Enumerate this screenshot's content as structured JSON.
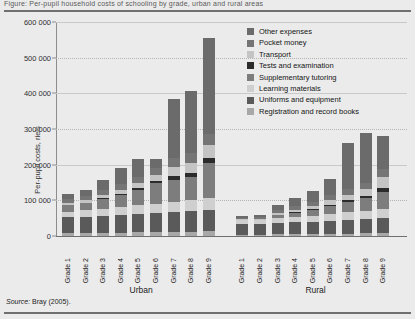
{
  "figure": {
    "title_strip": "Figure: Per-pupil household costs of schooling by grade, urban and rural areas",
    "source_prefix": "Source:",
    "source_text": "Bray (2005)."
  },
  "axis": {
    "ylabel": "Per-pupil costs, riels",
    "yticks": [
      "0",
      "100 000",
      "200 000",
      "300 000",
      "400 000",
      "500 000",
      "600 000"
    ],
    "ytick_values": [
      0,
      100000,
      200000,
      300000,
      400000,
      500000,
      600000
    ]
  },
  "groups": [
    {
      "name": "Urban",
      "label": "Urban"
    },
    {
      "name": "Rural",
      "label": "Rural"
    }
  ],
  "categories": [
    "Grade 1",
    "Grade 2",
    "Grade 3",
    "Grade 4",
    "Grade 5",
    "Grade 6",
    "Grade 7",
    "Grade 8",
    "Grade 9"
  ],
  "legend": {
    "position": "top-right",
    "items": [
      {
        "label": "Other expenses",
        "color": "#6b6b6b"
      },
      {
        "label": "Pocket money",
        "color": "#757575"
      },
      {
        "label": "Transport",
        "color": "#c4c4c4"
      },
      {
        "label": "Tests and examination",
        "color": "#2b2b2b"
      },
      {
        "label": "Supplementary tutoring",
        "color": "#7d7d7d"
      },
      {
        "label": "Learning materials",
        "color": "#cfcfcf"
      },
      {
        "label": "Uniforms and equipment",
        "color": "#5a5a5a"
      },
      {
        "label": "Registration and record books",
        "color": "#a8a8a8"
      }
    ]
  },
  "chart_data": {
    "type": "bar",
    "subtype": "stacked-bar-grouped",
    "title": "Per-pupil household costs of schooling by grade, urban and rural areas",
    "xlabel": "",
    "ylabel": "Per-pupil costs, riels",
    "ylim": [
      0,
      600000
    ],
    "ytick_step": 100000,
    "grid": true,
    "legend_position": "top-right",
    "categories": [
      "Grade 1",
      "Grade 2",
      "Grade 3",
      "Grade 4",
      "Grade 5",
      "Grade 6",
      "Grade 7",
      "Grade 8",
      "Grade 9"
    ],
    "groups": [
      "Urban",
      "Rural"
    ],
    "series": [
      {
        "name": "Registration and record books",
        "color": "#a8a8a8",
        "values": {
          "Urban": [
            8000,
            8000,
            9000,
            9000,
            10000,
            10000,
            12000,
            12000,
            14000
          ],
          "Rural": [
            4000,
            4000,
            5000,
            5000,
            6000,
            6000,
            7000,
            8000,
            9000
          ]
        }
      },
      {
        "name": "Uniforms and equipment",
        "color": "#5a5a5a",
        "values": {
          "Urban": [
            44000,
            46000,
            48000,
            50000,
            52000,
            54000,
            56000,
            58000,
            60000
          ],
          "Rural": [
            30000,
            30000,
            32000,
            33000,
            34000,
            36000,
            38000,
            40000,
            42000
          ]
        }
      },
      {
        "name": "Learning materials",
        "color": "#cfcfcf",
        "values": {
          "Urban": [
            16000,
            18000,
            20000,
            22000,
            24000,
            26000,
            28000,
            30000,
            32000
          ],
          "Rural": [
            10000,
            11000,
            13000,
            15000,
            17000,
            19000,
            21000,
            23000,
            25000
          ]
        }
      },
      {
        "name": "Supplementary tutoring",
        "color": "#7d7d7d",
        "values": {
          "Urban": [
            18000,
            20000,
            26000,
            34000,
            44000,
            58000,
            60000,
            66000,
            100000
          ],
          "Rural": [
            0,
            0,
            8000,
            12000,
            16000,
            24000,
            30000,
            36000,
            48000
          ]
        }
      },
      {
        "name": "Tests and examination",
        "color": "#2b2b2b",
        "values": {
          "Urban": [
            2000,
            2000,
            3000,
            4000,
            5000,
            6000,
            12000,
            12000,
            14000
          ],
          "Rural": [
            1000,
            1000,
            2000,
            2000,
            3000,
            3000,
            4000,
            5000,
            12000
          ]
        }
      },
      {
        "name": "Transport",
        "color": "#c4c4c4",
        "values": {
          "Urban": [
            6000,
            7000,
            9000,
            11000,
            14000,
            18000,
            26000,
            28000,
            36000
          ],
          "Rural": [
            2000,
            2000,
            4000,
            6000,
            8000,
            12000,
            16000,
            20000,
            30000
          ]
        }
      },
      {
        "name": "Pocket money",
        "color": "#757575",
        "values": {
          "Urban": [
            10000,
            11000,
            13000,
            15000,
            18000,
            20000,
            24000,
            26000,
            30000
          ],
          "Rural": [
            5000,
            6000,
            8000,
            10000,
            12000,
            14000,
            16000,
            18000,
            22000
          ]
        }
      },
      {
        "name": "Other expenses",
        "color": "#6b6b6b",
        "values": {
          "Urban": [
            14000,
            16000,
            30000,
            46000,
            50000,
            24000,
            166000,
            174000,
            270000
          ],
          "Rural": [
            4000,
            6000,
            14000,
            25000,
            30000,
            46000,
            128000,
            140000,
            92000
          ]
        }
      }
    ],
    "totals": {
      "Urban": [
        118000,
        128000,
        158000,
        191000,
        217000,
        216000,
        384000,
        406000,
        556000
      ],
      "Rural": [
        56000,
        60000,
        86000,
        108000,
        126000,
        160000,
        260000,
        290000,
        280000
      ]
    }
  }
}
